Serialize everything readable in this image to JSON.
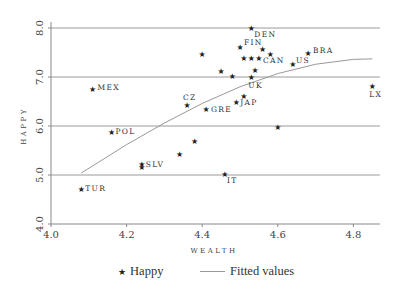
{
  "chart_data": {
    "type": "scatter",
    "title": "",
    "xlabel": "WEALTH",
    "ylabel": "HAPPY",
    "xlim": [
      4.0,
      4.87
    ],
    "ylim": [
      4.0,
      8.0
    ],
    "x_ticks": [
      "4.0",
      "4.2",
      "4.4",
      "4.6",
      "4.8"
    ],
    "y_ticks": [
      "4.0",
      "5.0",
      "6.0",
      "7.0",
      "8.0"
    ],
    "grid": "horizontal",
    "legend_position": "bottom",
    "legend": [
      "Happy",
      "Fitted values"
    ],
    "series": [
      {
        "name": "Happy",
        "marker": "star",
        "points": [
          {
            "x": 4.53,
            "y": 8.0,
            "label": "DEN"
          },
          {
            "x": 4.5,
            "y": 7.61,
            "label": "FIN"
          },
          {
            "x": 4.56,
            "y": 7.57,
            "label": ""
          },
          {
            "x": 4.58,
            "y": 7.47,
            "label": ""
          },
          {
            "x": 4.51,
            "y": 7.39,
            "label": ""
          },
          {
            "x": 4.53,
            "y": 7.39,
            "label": ""
          },
          {
            "x": 4.55,
            "y": 7.39,
            "label": "CAN"
          },
          {
            "x": 4.4,
            "y": 7.47,
            "label": ""
          },
          {
            "x": 4.45,
            "y": 7.12,
            "label": ""
          },
          {
            "x": 4.48,
            "y": 7.02,
            "label": ""
          },
          {
            "x": 4.54,
            "y": 7.14,
            "label": ""
          },
          {
            "x": 4.53,
            "y": 7.0,
            "label": "UK"
          },
          {
            "x": 4.64,
            "y": 7.27,
            "label": "US"
          },
          {
            "x": 4.68,
            "y": 7.49,
            "label": "BRA"
          },
          {
            "x": 4.85,
            "y": 6.82,
            "label": "LX"
          },
          {
            "x": 4.11,
            "y": 6.76,
            "label": "MEX"
          },
          {
            "x": 4.36,
            "y": 6.43,
            "label": "CZ"
          },
          {
            "x": 4.41,
            "y": 6.35,
            "label": "GRE"
          },
          {
            "x": 4.49,
            "y": 6.49,
            "label": "JAP"
          },
          {
            "x": 4.51,
            "y": 6.61,
            "label": ""
          },
          {
            "x": 4.6,
            "y": 5.98,
            "label": ""
          },
          {
            "x": 4.16,
            "y": 5.88,
            "label": "POL"
          },
          {
            "x": 4.38,
            "y": 5.69,
            "label": ""
          },
          {
            "x": 4.34,
            "y": 5.43,
            "label": ""
          },
          {
            "x": 4.24,
            "y": 5.22,
            "label": "SLV"
          },
          {
            "x": 4.24,
            "y": 5.16,
            "label": ""
          },
          {
            "x": 4.46,
            "y": 5.02,
            "label": "IT"
          },
          {
            "x": 4.08,
            "y": 4.71,
            "label": "TUR"
          }
        ]
      },
      {
        "name": "Fitted values",
        "type": "line",
        "points": [
          {
            "x": 4.08,
            "y": 5.04
          },
          {
            "x": 4.2,
            "y": 5.62
          },
          {
            "x": 4.3,
            "y": 6.06
          },
          {
            "x": 4.4,
            "y": 6.46
          },
          {
            "x": 4.5,
            "y": 6.8
          },
          {
            "x": 4.6,
            "y": 7.07
          },
          {
            "x": 4.7,
            "y": 7.26
          },
          {
            "x": 4.8,
            "y": 7.36
          },
          {
            "x": 4.85,
            "y": 7.37
          }
        ]
      }
    ]
  },
  "legend": {
    "happy_label": "Happy",
    "fitted_label": "Fitted values",
    "star_glyph": "★"
  },
  "colors": {
    "grid": "#9a9a9a",
    "axis": "#888888",
    "fitted_line": "#999999",
    "marker": "#222222"
  }
}
